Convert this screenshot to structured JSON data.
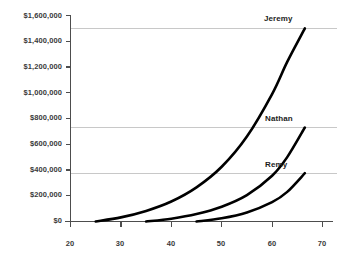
{
  "chart_data": {
    "type": "line",
    "title": "",
    "xlabel": "",
    "ylabel": "",
    "xlim": [
      20,
      70
    ],
    "ylim": [
      0,
      1600000
    ],
    "grid": true,
    "gridlines_y": [
      1500000,
      730000,
      375000
    ],
    "legend_position": "inline-right-end-of-curve",
    "x_ticks": [
      20,
      30,
      40,
      50,
      60,
      70
    ],
    "x_tick_labels": [
      "20",
      "30",
      "40",
      "50",
      "60",
      "70"
    ],
    "y_ticks": [
      0,
      200000,
      400000,
      600000,
      800000,
      1000000,
      1200000,
      1400000,
      1600000
    ],
    "y_tick_labels": [
      "$0",
      "$200,000",
      "$400,000",
      "$600,000",
      "$800,000",
      "$1,000,000",
      "$1,200,000",
      "$1,400,000",
      "$1,600,000"
    ],
    "series": [
      {
        "name": "Jeremy",
        "color": "#000000",
        "start_x": 25,
        "end_x": 66.5,
        "end_value": 1500000,
        "points": [
          {
            "x": 25,
            "y": 0
          },
          {
            "x": 30,
            "y": 32000
          },
          {
            "x": 35,
            "y": 82000
          },
          {
            "x": 40,
            "y": 155000
          },
          {
            "x": 45,
            "y": 265000
          },
          {
            "x": 50,
            "y": 425000
          },
          {
            "x": 55,
            "y": 660000
          },
          {
            "x": 60,
            "y": 990000
          },
          {
            "x": 63,
            "y": 1240000
          },
          {
            "x": 66.5,
            "y": 1500000
          }
        ]
      },
      {
        "name": "Nathan",
        "color": "#000000",
        "start_x": 35,
        "end_x": 66.5,
        "end_value": 730000,
        "points": [
          {
            "x": 35,
            "y": 0
          },
          {
            "x": 40,
            "y": 22000
          },
          {
            "x": 45,
            "y": 58000
          },
          {
            "x": 50,
            "y": 115000
          },
          {
            "x": 55,
            "y": 205000
          },
          {
            "x": 60,
            "y": 355000
          },
          {
            "x": 63,
            "y": 500000
          },
          {
            "x": 66.5,
            "y": 730000
          }
        ]
      },
      {
        "name": "Remy",
        "color": "#000000",
        "start_x": 45,
        "end_x": 66.5,
        "end_value": 375000,
        "points": [
          {
            "x": 45,
            "y": 0
          },
          {
            "x": 50,
            "y": 25000
          },
          {
            "x": 55,
            "y": 70000
          },
          {
            "x": 60,
            "y": 150000
          },
          {
            "x": 63,
            "y": 230000
          },
          {
            "x": 66.5,
            "y": 375000
          }
        ]
      }
    ]
  },
  "axes": {
    "y_labels": [
      "$1,600,000",
      "$1,400,000",
      "$1,200,000",
      "$1,000,000",
      "$800,000",
      "$600,000",
      "$400,000",
      "$200,000",
      "$0"
    ],
    "x_labels": [
      "20",
      "30",
      "40",
      "50",
      "60",
      "70"
    ]
  },
  "series_labels": {
    "jeremy": "Jeremy",
    "nathan": "Nathan",
    "remy": "Remy"
  },
  "colors": {
    "curve": "#000000",
    "axis": "#4d4d4d",
    "gridline": "#c8c8c8",
    "text": "#3a3a3a"
  }
}
